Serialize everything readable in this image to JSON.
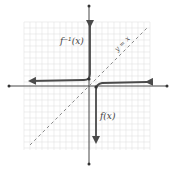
{
  "figure": {
    "labels": {
      "inverse": "f⁻¹(x)",
      "function": "f(x)",
      "mirror_line": "y = x"
    },
    "colors": {
      "curve": "#4a4a4a",
      "axis": "#333333",
      "grid": "#e3e3e3",
      "mirror_line": "#8a8a8a",
      "label": "#444444"
    },
    "grid": {
      "x0": 24,
      "y0": 22,
      "x1": 150,
      "y1": 150,
      "step": 6
    },
    "axes": {
      "x_axis": {
        "y": 86,
        "x_start": 8,
        "x_end": 168
      },
      "y_axis": {
        "x": 89,
        "y_start": 5,
        "y_end": 165
      }
    },
    "curves": [
      {
        "name": "inverse",
        "path": "M 90 26 L 90 74 Q 90 80 84 80 L 30 81"
      },
      {
        "name": "function",
        "path": "M 147 82 L 102 83 Q 96 84 96 90 L 96 142"
      }
    ],
    "mirror_line": {
      "x1": 30,
      "y1": 145,
      "x2": 147,
      "y2": 28
    }
  }
}
